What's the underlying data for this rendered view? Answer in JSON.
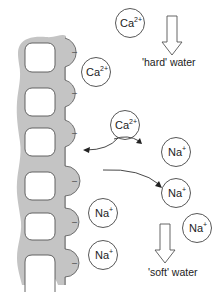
{
  "diagram": {
    "colors": {
      "resin_fill": "#c4c4c4",
      "resin_stroke": "#555555",
      "circle_stroke": "#444444",
      "text": "#222222"
    },
    "resin": {
      "site_charge": "–",
      "sites": [
        {
          "y": 52
        },
        {
          "y": 93
        },
        {
          "y": 133
        },
        {
          "y": 181
        },
        {
          "y": 222
        },
        {
          "y": 263
        }
      ]
    },
    "ions": [
      {
        "symbol": "Ca",
        "charge": "2+",
        "cx": 130,
        "cy": 23,
        "state": "in hard water"
      },
      {
        "symbol": "Ca",
        "charge": "2+",
        "cx": 80,
        "cy": 72,
        "state": "bound to resin"
      },
      {
        "symbol": "Ca",
        "charge": "2+",
        "cx": 125,
        "cy": 125,
        "state": "exchanging"
      },
      {
        "symbol": "Na",
        "charge": "+",
        "cx": 160,
        "cy": 155,
        "state": "released"
      },
      {
        "symbol": "Na",
        "charge": "+",
        "cx": 160,
        "cy": 193,
        "state": "released"
      },
      {
        "symbol": "Na",
        "charge": "+",
        "cx": 196,
        "cy": 228,
        "state": "in soft water"
      },
      {
        "symbol": "Na",
        "charge": "+",
        "cx": 80,
        "cy": 230,
        "state": "bound to resin"
      },
      {
        "symbol": "Na",
        "charge": "+",
        "cx": 80,
        "cy": 272,
        "state": "bound to resin"
      }
    ],
    "labels": {
      "hard_water": "'hard' water",
      "soft_water": "'soft' water"
    },
    "ion_labels": {
      "ca_1": "Ca",
      "ca_1_charge": "2+",
      "ca_2": "Ca",
      "ca_2_charge": "2+",
      "ca_3": "Ca",
      "ca_3_charge": "2+",
      "na_1": "Na",
      "na_1_charge": "+",
      "na_2": "Na",
      "na_2_charge": "+",
      "na_3": "Na",
      "na_3_charge": "+",
      "na_4": "Na",
      "na_4_charge": "+",
      "na_5": "Na",
      "na_5_charge": "+"
    },
    "site_labels": [
      "–",
      "–",
      "–",
      "–",
      "–",
      "–"
    ]
  }
}
